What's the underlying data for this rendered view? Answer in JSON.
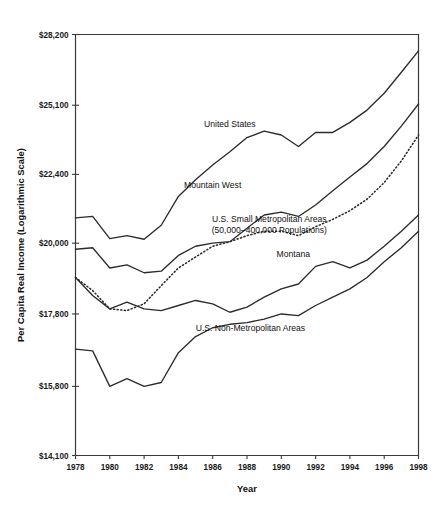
{
  "chart_data": {
    "type": "line",
    "title": "",
    "xlabel": "Year",
    "ylabel": "Per Capita Real Income (Logarithmic Scale)",
    "scale": "log",
    "grid": false,
    "legend_position": "inline-labels",
    "x": [
      1978,
      1979,
      1980,
      1981,
      1982,
      1983,
      1984,
      1985,
      1986,
      1987,
      1988,
      1989,
      1990,
      1991,
      1992,
      1993,
      1994,
      1995,
      1996,
      1997,
      1998
    ],
    "xlim": [
      1978,
      1998
    ],
    "xticks": [
      1978,
      1980,
      1982,
      1984,
      1986,
      1988,
      1990,
      1992,
      1994,
      1996,
      1998
    ],
    "xtick_labels": [
      "1978",
      "1980",
      "1982",
      "1984",
      "1986",
      "1988",
      "1990",
      "1992",
      "1994",
      "1996",
      "1998"
    ],
    "ylim": [
      14100,
      28200
    ],
    "yticks": [
      14100,
      15800,
      17800,
      20000,
      22400,
      25100,
      28200
    ],
    "ytick_labels": [
      "$14,100",
      "$15,800",
      "$17,800",
      "$20,000",
      "$22,400",
      "$25,100",
      "$28,200"
    ],
    "series": [
      {
        "name": "United States",
        "style": "solid",
        "label": "United States",
        "label_x": 1987.0,
        "label_y": 24200,
        "values": [
          20850,
          20900,
          20150,
          20250,
          20130,
          20600,
          21600,
          22200,
          22750,
          23250,
          23800,
          24050,
          23900,
          23450,
          24000,
          24000,
          24400,
          24900,
          25600,
          26500,
          27450
        ]
      },
      {
        "name": "Mountain West",
        "style": "solid",
        "label": "Mountain West",
        "label_x": 1986.0,
        "label_y": 21900,
        "values": [
          19800,
          19850,
          19200,
          19300,
          19050,
          19100,
          19600,
          19900,
          20000,
          20050,
          20500,
          20950,
          21050,
          20900,
          21300,
          21800,
          22300,
          22800,
          23450,
          24250,
          25150
        ]
      },
      {
        "name": "U.S. Small Metropolitan Areas",
        "style": "dotted",
        "label": "U.S. Small Metropolitan Areas",
        "label_sub": "(50,000–400,000 Populations)",
        "label_x": 1989.3,
        "label_y": 20700,
        "values": [
          18900,
          18500,
          17950,
          17900,
          18100,
          18650,
          19200,
          19550,
          19900,
          20050,
          20250,
          20400,
          20400,
          20250,
          20550,
          20800,
          21100,
          21500,
          22100,
          22900,
          23900
        ]
      },
      {
        "name": "Montana",
        "style": "solid",
        "label": "Montana",
        "label_x": 1990.7,
        "label_y": 19550,
        "values": [
          18900,
          18350,
          17950,
          18150,
          17950,
          17900,
          18050,
          18200,
          18100,
          17850,
          18000,
          18300,
          18550,
          18700,
          19250,
          19400,
          19200,
          19450,
          19900,
          20400,
          20950
        ]
      },
      {
        "name": "U.S. Non-Metropolitan Areas",
        "style": "solid",
        "label": "U.S. Non-Metropolitan Areas",
        "label_x": 1988.2,
        "label_y": 17300,
        "values": [
          16800,
          16750,
          15800,
          16000,
          15800,
          15900,
          16700,
          17150,
          17400,
          17500,
          17550,
          17650,
          17800,
          17750,
          18050,
          18300,
          18550,
          18900,
          19400,
          19850,
          20400
        ]
      }
    ]
  }
}
